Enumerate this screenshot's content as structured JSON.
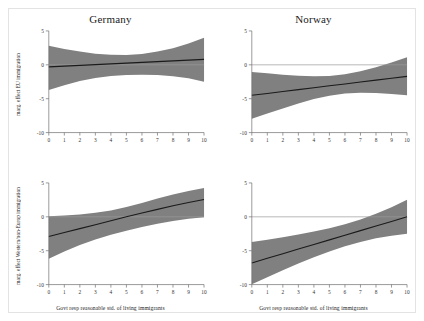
{
  "figure": {
    "background_color": "#ffffff",
    "frame_color": "#e3e3e3",
    "band_color": "#808080",
    "line_color": "#1a1a1a",
    "axis_color": "#6f6f6f"
  },
  "labels": {
    "ylabel_top": "marg. effect EU immigration",
    "ylabel_bottom": "marg. effect Western/non-Europ immigration",
    "xlabel": "Govt resp reasonable std. of living immigrants",
    "title_left": "Germany",
    "title_right": "Norway"
  },
  "axis": {
    "xticks": [
      "0",
      "1",
      "2",
      "3",
      "4",
      "5",
      "6",
      "7",
      "8",
      "9",
      "10"
    ],
    "yticks": [
      "5",
      "0",
      "-5",
      "-10"
    ]
  },
  "chart_data": [
    {
      "id": "germany-eu",
      "type": "line",
      "title": "Germany",
      "xlabel": "Govt resp reasonable std. of living immigrants",
      "ylabel": "marg. effect EU immigration",
      "xlim": [
        0,
        10
      ],
      "ylim": [
        -10,
        5
      ],
      "grid": false,
      "legend": "none",
      "x": [
        0,
        1,
        2,
        3,
        4,
        5,
        6,
        7,
        8,
        9,
        10
      ],
      "series": [
        {
          "name": "marginal effect",
          "values": [
            -0.3,
            -0.19,
            -0.08,
            0.03,
            0.14,
            0.25,
            0.36,
            0.47,
            0.58,
            0.69,
            0.8
          ]
        },
        {
          "name": "ci_upper",
          "values": [
            2.8,
            2.35,
            1.95,
            1.65,
            1.48,
            1.45,
            1.6,
            1.95,
            2.45,
            3.15,
            4.0
          ]
        },
        {
          "name": "ci_lower",
          "values": [
            -3.7,
            -3.0,
            -2.4,
            -1.95,
            -1.65,
            -1.5,
            -1.45,
            -1.5,
            -1.7,
            -2.0,
            -2.5
          ]
        }
      ],
      "zero_line": 0
    },
    {
      "id": "norway-eu",
      "type": "line",
      "title": "Norway",
      "xlabel": "Govt resp reasonable std. of living immigrants",
      "ylabel": "marg. effect EU immigration",
      "xlim": [
        0,
        10
      ],
      "ylim": [
        -10,
        5
      ],
      "grid": false,
      "legend": "none",
      "x": [
        0,
        1,
        2,
        3,
        4,
        5,
        6,
        7,
        8,
        9,
        10
      ],
      "series": [
        {
          "name": "marginal effect",
          "values": [
            -4.5,
            -4.22,
            -3.94,
            -3.66,
            -3.38,
            -3.1,
            -2.82,
            -2.54,
            -2.26,
            -1.98,
            -1.7
          ]
        },
        {
          "name": "ci_upper",
          "values": [
            -1.05,
            -1.25,
            -1.45,
            -1.6,
            -1.7,
            -1.65,
            -1.4,
            -0.95,
            -0.35,
            0.35,
            1.1
          ]
        },
        {
          "name": "ci_lower",
          "values": [
            -7.95,
            -7.2,
            -6.45,
            -5.72,
            -5.06,
            -4.55,
            -4.24,
            -4.13,
            -4.17,
            -4.31,
            -4.5
          ]
        }
      ],
      "zero_line": 0
    },
    {
      "id": "germany-western-noneurop",
      "type": "line",
      "title": "Germany",
      "xlabel": "Govt resp reasonable std. of living immigrants",
      "ylabel": "marg. effect Western/non-Europ immigration",
      "xlim": [
        0,
        10
      ],
      "ylim": [
        -10,
        5
      ],
      "grid": false,
      "legend": "none",
      "x": [
        0,
        1,
        2,
        3,
        4,
        5,
        6,
        7,
        8,
        9,
        10
      ],
      "series": [
        {
          "name": "marginal effect",
          "values": [
            -2.9,
            -2.32,
            -1.74,
            -1.16,
            -0.58,
            0.0,
            0.56,
            1.1,
            1.62,
            2.1,
            2.55
          ]
        },
        {
          "name": "ci_upper",
          "values": [
            0.1,
            0.2,
            0.35,
            0.6,
            0.95,
            1.45,
            2.05,
            2.7,
            3.3,
            3.8,
            4.25
          ]
        },
        {
          "name": "ci_lower",
          "values": [
            -6.2,
            -5.1,
            -4.15,
            -3.35,
            -2.65,
            -2.05,
            -1.5,
            -1.02,
            -0.62,
            -0.3,
            -0.05
          ]
        }
      ],
      "zero_line": 0
    },
    {
      "id": "norway-western-noneurop",
      "type": "line",
      "title": "Norway",
      "xlabel": "Govt resp reasonable std. of living immigrants",
      "ylabel": "marg. effect Western/non-Europ immigration",
      "xlim": [
        0,
        10
      ],
      "ylim": [
        -10,
        5
      ],
      "grid": false,
      "legend": "none",
      "x": [
        0,
        1,
        2,
        3,
        4,
        5,
        6,
        7,
        8,
        9,
        10
      ],
      "series": [
        {
          "name": "marginal effect",
          "values": [
            -6.8,
            -6.12,
            -5.44,
            -4.76,
            -4.08,
            -3.4,
            -2.72,
            -2.04,
            -1.36,
            -0.68,
            0.0
          ]
        },
        {
          "name": "ci_upper",
          "values": [
            -3.7,
            -3.38,
            -3.02,
            -2.62,
            -2.18,
            -1.7,
            -1.1,
            -0.38,
            0.45,
            1.4,
            2.5
          ]
        },
        {
          "name": "ci_lower",
          "values": [
            -9.95,
            -8.9,
            -7.88,
            -6.9,
            -5.98,
            -5.1,
            -4.34,
            -3.7,
            -3.18,
            -2.78,
            -2.5
          ]
        }
      ],
      "zero_line": 0
    }
  ]
}
